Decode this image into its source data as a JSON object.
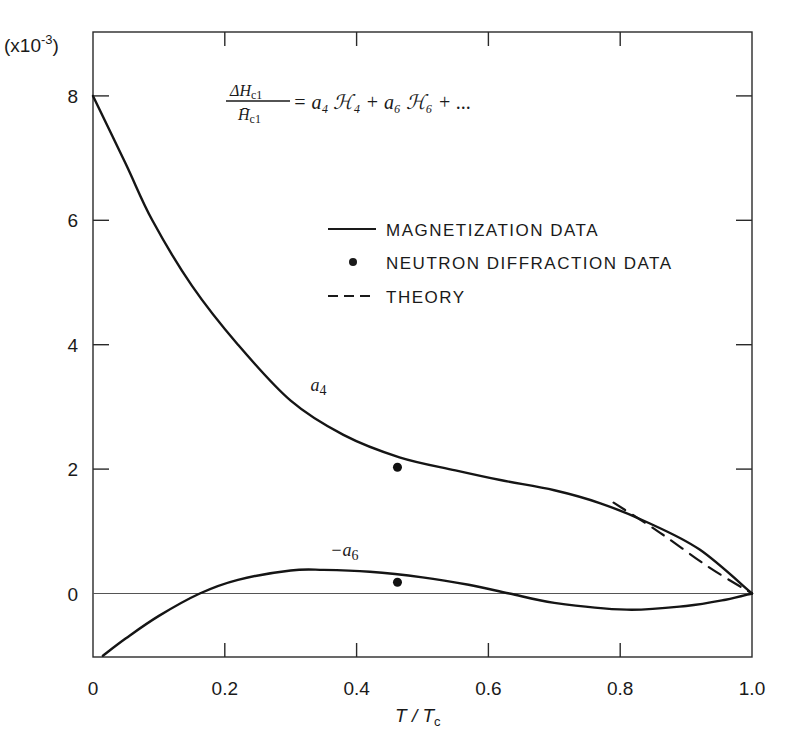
{
  "chart_data": {
    "type": "line",
    "title": "",
    "equation": {
      "lhs_num": "ΔH",
      "lhs_num_sub": "c1",
      "lhs_den": "H̄",
      "lhs_den_sub": "c1",
      "rhs": "= a₄ ℋ₄ + a₆ ℋ₆ + ..."
    },
    "xlabel": "T/Tc",
    "xlabel_main": "T / T",
    "xlabel_sub": "c",
    "ylabel": "",
    "y_multiplier": "(x10⁻³)",
    "y_multiplier_base": "(x10",
    "y_multiplier_exp": "-3",
    "y_multiplier_close": ")",
    "xlim": [
      0,
      1.0
    ],
    "ylim": [
      -1,
      9
    ],
    "x_ticks": [
      0,
      0.2,
      0.4,
      0.6,
      0.8,
      1.0
    ],
    "x_tick_labels": [
      "0",
      "0.2",
      "0.4",
      "0.6",
      "0.8",
      "1.0"
    ],
    "y_ticks": [
      0,
      2,
      4,
      6,
      8
    ],
    "y_tick_labels": [
      "0",
      "2",
      "4",
      "6",
      "8"
    ],
    "grid": false,
    "zero_line": true,
    "legend_position": "upper right (inside)",
    "legend": [
      {
        "label": "MAGNETIZATION DATA",
        "style": "solid"
      },
      {
        "label": "NEUTRON DIFFRACTION DATA",
        "style": "dot"
      },
      {
        "label": "THEORY",
        "style": "dashed"
      }
    ],
    "series": [
      {
        "name": "a4 (magnetization data)",
        "label": "a4",
        "style": "solid",
        "x": [
          0.0,
          0.05,
          0.09,
          0.15,
          0.22,
          0.3,
          0.38,
          0.465,
          0.55,
          0.62,
          0.7,
          0.77,
          0.84,
          0.92,
          1.0
        ],
        "y": [
          8.0,
          6.9,
          6.0,
          4.95,
          4.0,
          3.1,
          2.55,
          2.19,
          1.98,
          1.82,
          1.66,
          1.45,
          1.15,
          0.71,
          0.0
        ]
      },
      {
        "name": "-a6 (magnetization data)",
        "label": "-a6",
        "style": "solid",
        "x": [
          0.015,
          0.05,
          0.1,
          0.162,
          0.22,
          0.3,
          0.35,
          0.42,
          0.5,
          0.57,
          0.632,
          0.7,
          0.81,
          0.9,
          0.96,
          1.0
        ],
        "y": [
          -1.0,
          -0.72,
          -0.36,
          0.0,
          0.22,
          0.37,
          0.38,
          0.35,
          0.26,
          0.14,
          0.0,
          -0.15,
          -0.26,
          -0.2,
          -0.1,
          0.0
        ]
      },
      {
        "name": "Neutron diffraction data",
        "style": "dot",
        "x": [
          0.462,
          0.462
        ],
        "y": [
          2.03,
          0.18
        ]
      },
      {
        "name": "Theory",
        "style": "dashed",
        "x": [
          0.79,
          0.86,
          0.935,
          1.0
        ],
        "y": [
          1.46,
          0.98,
          0.42,
          0.0
        ]
      }
    ],
    "annotations": [
      {
        "text": "a4",
        "x": 0.33,
        "y": 3.25
      },
      {
        "text": "-a6",
        "x": 0.36,
        "y": 0.6
      }
    ]
  }
}
